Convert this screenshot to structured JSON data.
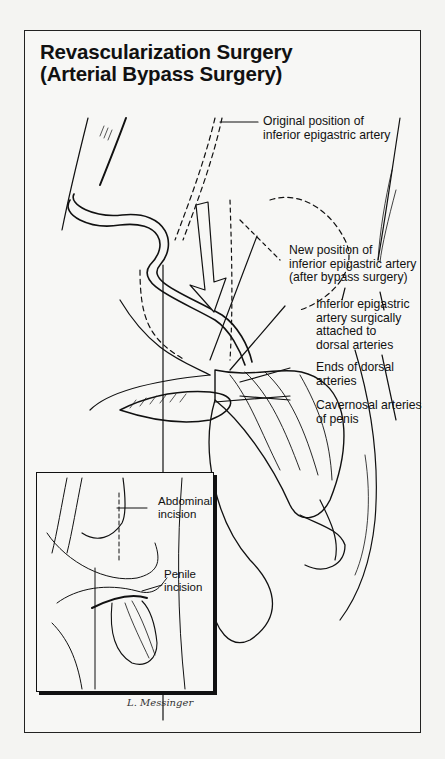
{
  "title": {
    "line1": "Revascularization Surgery",
    "line2": "(Arterial Bypass Surgery)"
  },
  "labels": {
    "original_position": {
      "line1": "Original position of",
      "line2": "inferior epigastric artery"
    },
    "new_position": {
      "line1": "New position of",
      "line2": "inferior epigastric artery",
      "line3": "(after bypass surgery)"
    },
    "attached": {
      "line1": "Inferior epigastric",
      "line2": "artery surgically",
      "line3": "attached to",
      "line4": "dorsal arteries"
    },
    "dorsal_ends": {
      "line1": "Ends of dorsal",
      "line2": "arteries"
    },
    "cavernosal": {
      "line1": "Cavernosal arteries",
      "line2": "of penis"
    }
  },
  "inset": {
    "abdominal": {
      "line1": "Abdominal",
      "line2": "incision"
    },
    "penile": {
      "line1": "Penile",
      "line2": "incision"
    }
  },
  "signature": "L. Messinger",
  "colors": {
    "ink": "#111111",
    "paper": "#f7f7f5",
    "background": "#f4f4f2"
  }
}
